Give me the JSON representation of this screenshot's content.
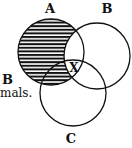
{
  "diagram": {
    "type": "venn",
    "sets": [
      {
        "label": "A",
        "cx": 51,
        "cy": 52,
        "r": 33
      },
      {
        "label": "B",
        "cx": 97,
        "cy": 56,
        "r": 33
      },
      {
        "label": "C",
        "cx": 73,
        "cy": 93,
        "r": 33
      }
    ],
    "shaded_region": "A minus B",
    "marker": "X",
    "side_text": {
      "line1": "B",
      "line2": "mals."
    },
    "colors": {
      "stroke": "#111111",
      "hatch": "#111111",
      "background": "#ffffff"
    }
  }
}
